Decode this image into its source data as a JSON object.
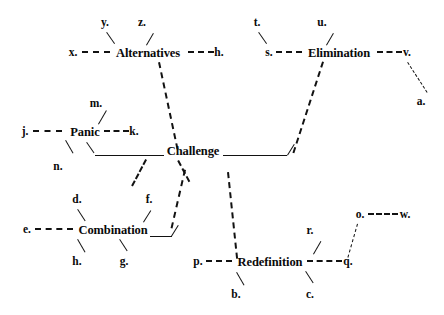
{
  "diagram": {
    "type": "radial-node-link",
    "ink_color": "#121212",
    "background": "#ffffff",
    "nodes": [
      {
        "id": "alternatives",
        "label": "Alternatives",
        "x": 148,
        "y": 53
      },
      {
        "id": "elimination",
        "label": "Elimination",
        "x": 339,
        "y": 53
      },
      {
        "id": "panic",
        "label": "Panic",
        "x": 85,
        "y": 132
      },
      {
        "id": "challenge",
        "label": "Challenge",
        "x": 193,
        "y": 151
      },
      {
        "id": "combination",
        "label": "Combination",
        "x": 113,
        "y": 230
      },
      {
        "id": "redefinition",
        "label": "Redefinition",
        "x": 270,
        "y": 262
      }
    ],
    "leaves": [
      {
        "id": "y",
        "label": "y.",
        "x": 105,
        "y": 23,
        "parent": "alternatives"
      },
      {
        "id": "z",
        "label": "z.",
        "x": 142,
        "y": 23,
        "parent": "alternatives"
      },
      {
        "id": "x",
        "label": "x.",
        "x": 73,
        "y": 53,
        "parent": "alternatives"
      },
      {
        "id": "h_top",
        "label": "h.",
        "x": 219,
        "y": 53,
        "parent": "alternatives"
      },
      {
        "id": "t",
        "label": "t.",
        "x": 257,
        "y": 23,
        "parent": "elimination"
      },
      {
        "id": "u",
        "label": "u.",
        "x": 322,
        "y": 23,
        "parent": "elimination"
      },
      {
        "id": "s",
        "label": "s.",
        "x": 269,
        "y": 53,
        "parent": "elimination"
      },
      {
        "id": "v",
        "label": "v.",
        "x": 407,
        "y": 53,
        "parent": "elimination"
      },
      {
        "id": "a",
        "label": "a.",
        "x": 421,
        "y": 102,
        "parent": "v"
      },
      {
        "id": "m",
        "label": "m.",
        "x": 96,
        "y": 104,
        "parent": "panic"
      },
      {
        "id": "j",
        "label": "j.",
        "x": 25,
        "y": 132,
        "parent": "panic"
      },
      {
        "id": "k",
        "label": "k.",
        "x": 134,
        "y": 132,
        "parent": "panic"
      },
      {
        "id": "n",
        "label": "n.",
        "x": 58,
        "y": 167,
        "parent": "panic"
      },
      {
        "id": "d",
        "label": "d.",
        "x": 77,
        "y": 200,
        "parent": "combination"
      },
      {
        "id": "f",
        "label": "f.",
        "x": 149,
        "y": 200,
        "parent": "combination"
      },
      {
        "id": "e",
        "label": "e.",
        "x": 27,
        "y": 230,
        "parent": "combination"
      },
      {
        "id": "h_bot",
        "label": "h.",
        "x": 77,
        "y": 262,
        "parent": "combination"
      },
      {
        "id": "g",
        "label": "g.",
        "x": 124,
        "y": 262,
        "parent": "combination"
      },
      {
        "id": "p",
        "label": "p.",
        "x": 198,
        "y": 262,
        "parent": "redefinition"
      },
      {
        "id": "q",
        "label": "q.",
        "x": 348,
        "y": 262,
        "parent": "redefinition"
      },
      {
        "id": "r",
        "label": "r.",
        "x": 310,
        "y": 231,
        "parent": "redefinition"
      },
      {
        "id": "b",
        "label": "b.",
        "x": 236,
        "y": 295,
        "parent": "redefinition"
      },
      {
        "id": "c",
        "label": "c.",
        "x": 310,
        "y": 295,
        "parent": "redefinition"
      },
      {
        "id": "o",
        "label": "o.",
        "x": 360,
        "y": 215,
        "parent": "q"
      },
      {
        "id": "w",
        "label": "w.",
        "x": 405,
        "y": 215,
        "parent": "o"
      }
    ],
    "edges": [
      {
        "from": "x",
        "to": "alternatives",
        "style": "dashed-horizontal"
      },
      {
        "from": "alternatives",
        "to": "h_top",
        "style": "dashed-horizontal"
      },
      {
        "from": "y",
        "to": "alternatives",
        "style": "backslash"
      },
      {
        "from": "z",
        "to": "alternatives",
        "style": "slash"
      },
      {
        "from": "alternatives",
        "to": "challenge",
        "style": "dashed-backslash"
      },
      {
        "from": "s",
        "to": "elimination",
        "style": "dashed-horizontal"
      },
      {
        "from": "elimination",
        "to": "v",
        "style": "dashed-horizontal"
      },
      {
        "from": "t",
        "to": "elimination",
        "style": "backslash"
      },
      {
        "from": "u",
        "to": "elimination",
        "style": "slash"
      },
      {
        "from": "v",
        "to": "a",
        "style": "dashed-backslash"
      },
      {
        "from": "elimination",
        "to": "challenge",
        "style": "dashed-slash"
      },
      {
        "from": "j",
        "to": "panic",
        "style": "dashed-horizontal"
      },
      {
        "from": "panic",
        "to": "k",
        "style": "dashed-horizontal"
      },
      {
        "from": "m",
        "to": "panic",
        "style": "slash"
      },
      {
        "from": "panic",
        "to": "n",
        "style": "slash"
      },
      {
        "from": "panic",
        "to": "challenge",
        "style": "solid-rule"
      },
      {
        "from": "challenge",
        "to": "combination",
        "style": "dashed-slash"
      },
      {
        "from": "challenge",
        "to": "redefinition",
        "style": "dashed-backslash"
      },
      {
        "from": "e",
        "to": "combination",
        "style": "dashed-horizontal"
      },
      {
        "from": "d",
        "to": "combination",
        "style": "backslash"
      },
      {
        "from": "f",
        "to": "combination",
        "style": "slash"
      },
      {
        "from": "combination",
        "to": "h_bot",
        "style": "slash"
      },
      {
        "from": "combination",
        "to": "g",
        "style": "backslash"
      },
      {
        "from": "p",
        "to": "redefinition",
        "style": "dashed-horizontal"
      },
      {
        "from": "redefinition",
        "to": "q",
        "style": "dashed-horizontal"
      },
      {
        "from": "r",
        "to": "redefinition",
        "style": "slash"
      },
      {
        "from": "redefinition",
        "to": "b",
        "style": "slash"
      },
      {
        "from": "redefinition",
        "to": "c",
        "style": "backslash"
      },
      {
        "from": "o",
        "to": "q",
        "style": "dashed-slash"
      },
      {
        "from": "o",
        "to": "w",
        "style": "dashed-horizontal"
      }
    ]
  }
}
